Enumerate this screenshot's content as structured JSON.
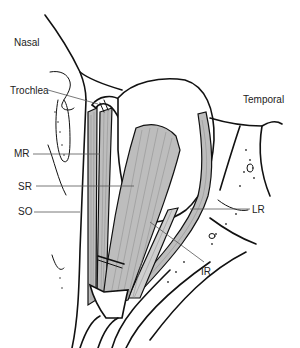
{
  "figure": {
    "orientation_labels": {
      "nasal": "Nasal",
      "temporal": "Temporal"
    },
    "structure_labels": [
      {
        "key": "trochlea",
        "text": "Trochlea"
      },
      {
        "key": "mr",
        "text": "MR"
      },
      {
        "key": "sr",
        "text": "SR"
      },
      {
        "key": "so",
        "text": "SO"
      },
      {
        "key": "lr",
        "text": "LR"
      },
      {
        "key": "ir",
        "text": "IR"
      }
    ],
    "colors": {
      "line": "#111111",
      "muscle_fill": "#bdbdbd",
      "background": "#ffffff"
    }
  }
}
